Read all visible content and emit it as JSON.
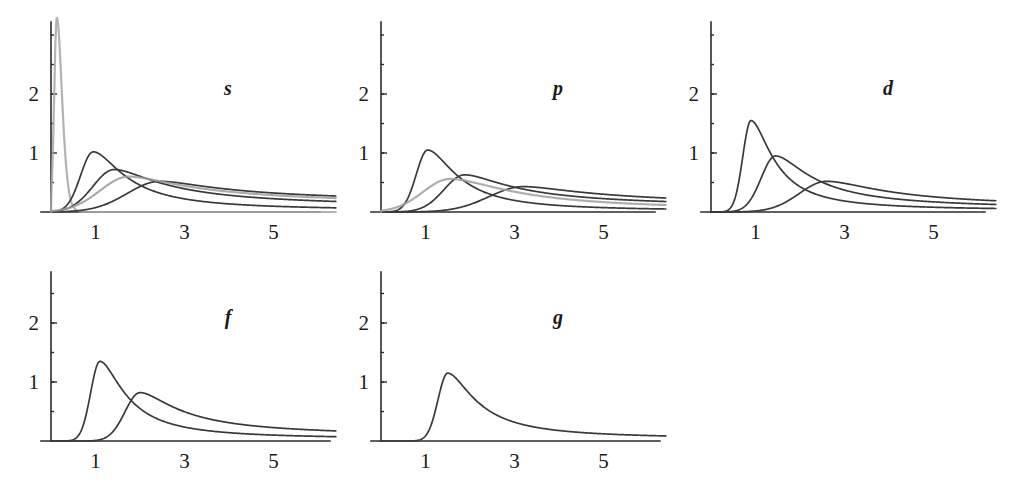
{
  "figure": {
    "title": "",
    "width": 1012,
    "height": 493,
    "background": "#ffffff",
    "ink_color": "#2b2b2b",
    "gray_color": "#9a9a9a"
  },
  "chart_data": {
    "type": "line",
    "title": "",
    "xlabel": "",
    "ylabel": "",
    "xlim": [
      0,
      6.4
    ],
    "ylim": [
      0,
      3.45
    ],
    "grid": false,
    "legend": "none",
    "xticks": [
      1,
      3,
      5
    ],
    "xtick_labels": [
      "1",
      "3",
      "5"
    ],
    "yticks": [
      1,
      2
    ],
    "ytick_labels": [
      "1",
      "2"
    ],
    "panels": [
      {
        "id": "s",
        "label": "s",
        "row": 0,
        "col": 0,
        "curves": [
          {
            "name": "1s",
            "color": "#a6a6a6",
            "peak_x": 0.13,
            "peak_y": 3.3,
            "width": 0.105,
            "skew": 0.55,
            "tail": 1.6
          },
          {
            "name": "2s",
            "color": "#3a3a3a",
            "peak_x": 0.95,
            "peak_y": 1.02,
            "width": 0.46,
            "skew": 0.62,
            "tail": 2.6
          },
          {
            "name": "3s",
            "color": "#3a3a3a",
            "peak_x": 1.42,
            "peak_y": 0.72,
            "width": 0.72,
            "skew": 0.66,
            "tail": 3.4
          },
          {
            "name": "4s",
            "color": "#3a3a3a",
            "peak_x": 2.45,
            "peak_y": 0.52,
            "width": 1.05,
            "skew": 0.7,
            "tail": 4.6
          },
          {
            "name": "5s",
            "color": "#9e9e9e",
            "peak_x": 1.75,
            "peak_y": 0.6,
            "width": 0.95,
            "skew": 0.68,
            "tail": 4.0
          }
        ]
      },
      {
        "id": "p",
        "label": "p",
        "row": 0,
        "col": 1,
        "curves": [
          {
            "name": "2p",
            "color": "#3a3a3a",
            "peak_x": 1.05,
            "peak_y": 1.05,
            "width": 0.43,
            "skew": 0.6,
            "tail": 2.7
          },
          {
            "name": "3p",
            "color": "#3a3a3a",
            "peak_x": 1.88,
            "peak_y": 0.63,
            "width": 0.72,
            "skew": 0.64,
            "tail": 3.8
          },
          {
            "name": "4p",
            "color": "#3a3a3a",
            "peak_x": 3.2,
            "peak_y": 0.43,
            "width": 1.1,
            "skew": 0.7,
            "tail": 5.6
          },
          {
            "name": "5p",
            "color": "#a0a0a0",
            "peak_x": 1.55,
            "peak_y": 0.56,
            "width": 0.92,
            "skew": 0.66,
            "tail": 4.6
          }
        ]
      },
      {
        "id": "d",
        "label": "d",
        "row": 0,
        "col": 2,
        "curves": [
          {
            "name": "3d",
            "color": "#3a3a3a",
            "peak_x": 0.9,
            "peak_y": 1.55,
            "width": 0.32,
            "skew": 0.58,
            "tail": 2.1
          },
          {
            "name": "4d",
            "color": "#3a3a3a",
            "peak_x": 1.45,
            "peak_y": 0.95,
            "width": 0.52,
            "skew": 0.62,
            "tail": 3.1
          },
          {
            "name": "5d",
            "color": "#3a3a3a",
            "peak_x": 2.6,
            "peak_y": 0.52,
            "width": 0.9,
            "skew": 0.68,
            "tail": 5.0
          }
        ]
      },
      {
        "id": "f",
        "label": "f",
        "row": 1,
        "col": 0,
        "curves": [
          {
            "name": "4f",
            "color": "#3a3a3a",
            "peak_x": 1.1,
            "peak_y": 1.35,
            "width": 0.36,
            "skew": 0.58,
            "tail": 2.4
          },
          {
            "name": "5f",
            "color": "#3a3a3a",
            "peak_x": 2.0,
            "peak_y": 0.82,
            "width": 0.56,
            "skew": 0.6,
            "tail": 3.6
          }
        ]
      },
      {
        "id": "g",
        "label": "g",
        "row": 1,
        "col": 1,
        "curves": [
          {
            "name": "5g",
            "color": "#3a3a3a",
            "peak_x": 1.5,
            "peak_y": 1.15,
            "width": 0.4,
            "skew": 0.55,
            "tail": 2.9
          }
        ]
      }
    ]
  },
  "layout": {
    "panel_geometry": [
      {
        "id": "s",
        "left": 0,
        "top": 0,
        "origin_x": 51,
        "origin_y": 212,
        "px_per_x": 44.5,
        "px_per_y": 59,
        "axis_top": 22,
        "axis_right": 320,
        "label_x": 228,
        "label_y": 95
      },
      {
        "id": "p",
        "left": 0,
        "top": 0,
        "origin_x": 381,
        "origin_y": 212,
        "px_per_x": 44.5,
        "px_per_y": 59,
        "axis_top": 22,
        "axis_right": 655,
        "label_x": 558,
        "label_y": 95
      },
      {
        "id": "d",
        "left": 0,
        "top": 0,
        "origin_x": 711,
        "origin_y": 212,
        "px_per_x": 44.5,
        "px_per_y": 59,
        "axis_top": 22,
        "axis_right": 985,
        "label_x": 888,
        "label_y": 95
      },
      {
        "id": "f",
        "left": 0,
        "top": 0,
        "origin_x": 51,
        "origin_y": 441,
        "px_per_x": 44.5,
        "px_per_y": 59,
        "axis_top": 272,
        "axis_right": 330,
        "label_x": 228,
        "label_y": 324
      },
      {
        "id": "g",
        "left": 0,
        "top": 0,
        "origin_x": 381,
        "origin_y": 441,
        "px_per_x": 44.5,
        "px_per_y": 59,
        "axis_top": 272,
        "axis_right": 660,
        "label_x": 558,
        "label_y": 324
      }
    ]
  }
}
